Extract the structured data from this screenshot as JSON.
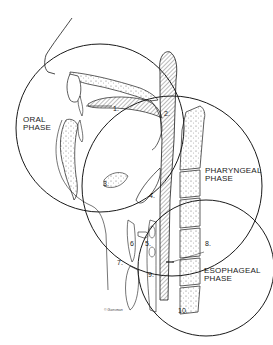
{
  "figure": {
    "type": "anatomical-line-drawing",
    "colors": {
      "line": "#1a1a1a",
      "background": "#ffffff",
      "hatch": "#888888",
      "stipple": "#555555"
    }
  },
  "phases": [
    {
      "id": "oral",
      "line1": "ORAL",
      "line2": "PHASE",
      "circle": {
        "cx": 100,
        "cy": 128,
        "r": 84
      }
    },
    {
      "id": "pharyngeal",
      "line1": "PHARYNGEAL",
      "line2": "PHASE",
      "circle": {
        "cx": 172,
        "cy": 186,
        "r": 90
      }
    },
    {
      "id": "esophageal",
      "line1": "ESOPHAGEAL",
      "line2": "PHASE",
      "circle": {
        "cx": 206,
        "cy": 268,
        "r": 68
      }
    }
  ],
  "numbers": {
    "n1": "1.",
    "n2": "2.",
    "n3": "3.",
    "n4": "4.",
    "n5": "5.",
    "n6": "6",
    "n7": "7.",
    "n8": "8.",
    "n9": "9.",
    "n10": "10."
  },
  "signature": "© Gansman"
}
